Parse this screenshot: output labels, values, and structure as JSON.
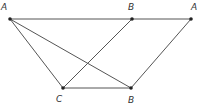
{
  "diagram": {
    "type": "geometry",
    "points": [
      {
        "id": "A",
        "label": "A",
        "x": 10,
        "y": 19,
        "lx": 1,
        "ly": 10
      },
      {
        "id": "B_top",
        "label": "B",
        "x": 132,
        "y": 19,
        "lx": 128,
        "ly": 10
      },
      {
        "id": "A_prime",
        "label": "A",
        "x": 191,
        "y": 19,
        "lx": 191,
        "ly": 10
      },
      {
        "id": "C",
        "label": "C",
        "x": 63,
        "y": 88,
        "lx": 56,
        "ly": 102
      },
      {
        "id": "B_bottom",
        "label": "B",
        "x": 131,
        "y": 88,
        "lx": 128,
        "ly": 103
      }
    ],
    "segments": [
      {
        "from": "A",
        "to": "A_prime"
      },
      {
        "from": "A",
        "to": "C"
      },
      {
        "from": "A",
        "to": "B_bottom"
      },
      {
        "from": "C",
        "to": "B_top"
      },
      {
        "from": "C",
        "to": "B_bottom"
      },
      {
        "from": "B_bottom",
        "to": "A_prime"
      }
    ],
    "colors": {
      "line": "#555555",
      "point": "#222222",
      "label": "#333333"
    }
  }
}
